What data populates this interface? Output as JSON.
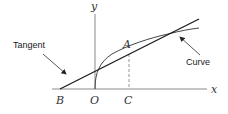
{
  "diagram": {
    "type": "tangent-to-curve",
    "axes": {
      "x_label": "x",
      "y_label": "y",
      "origin_label": "O"
    },
    "points": {
      "A": "A",
      "B": "B",
      "C": "C"
    },
    "callouts": {
      "tangent": "Tangent",
      "curve": "Curve"
    },
    "colors": {
      "axis": "#8a8a8a",
      "tangent": "#1a1a1a",
      "curve": "#444444",
      "dashed": "#888888",
      "text": "#222222"
    }
  }
}
